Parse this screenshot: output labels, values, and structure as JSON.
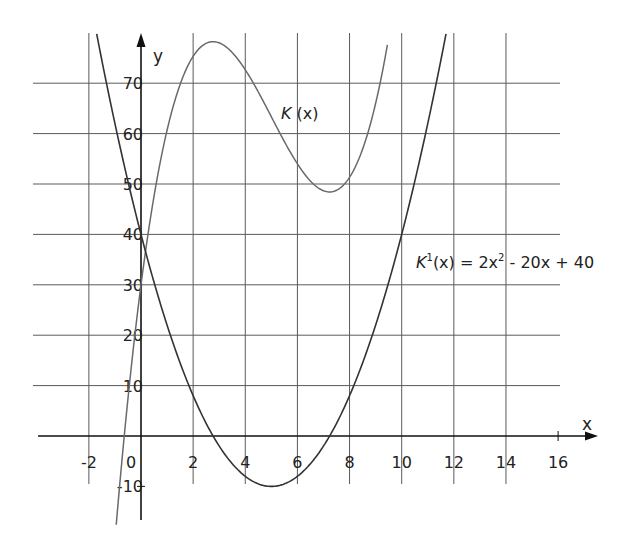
{
  "chart_data": {
    "type": "line",
    "title": "",
    "xlabel": "x",
    "ylabel": "y",
    "xlim": [
      -4.2,
      17.5
    ],
    "ylim": [
      -16.6,
      80
    ],
    "grid": true,
    "x_ticks": [
      -2,
      0,
      2,
      4,
      6,
      8,
      10,
      12,
      14,
      16
    ],
    "x_tick_labels": [
      "-2",
      "0",
      "2",
      "4",
      "6",
      "8",
      "10",
      "12",
      "14",
      "16"
    ],
    "y_ticks": [
      -10,
      10,
      20,
      30,
      40,
      50,
      60,
      70
    ],
    "y_tick_labels": [
      "-10",
      "10",
      "20",
      "30",
      "40",
      "50",
      "60",
      "70"
    ],
    "grid_x": [
      -2,
      2,
      4,
      6,
      8,
      10,
      12,
      14
    ],
    "grid_y": [
      10,
      20,
      30,
      40,
      50,
      60,
      70
    ],
    "series": [
      {
        "name": "K(x)",
        "formula": "K(x) = (2/3)x^3 - 10x^2 + 40x + 30",
        "coefficients": [
          30,
          40,
          -10,
          0.6667
        ],
        "x_range": [
          -0.95,
          9.45
        ],
        "key_points": [
          [
            0,
            30
          ],
          [
            2.76,
            78.2
          ],
          [
            7.24,
            48.6
          ]
        ],
        "color": "#6a6a6a"
      },
      {
        "name": "K'(x)",
        "formula": "K'(x) = 2x^2 - 20x + 40",
        "coefficients": [
          40,
          -20,
          2
        ],
        "x_range": [
          -1.7,
          11.7
        ],
        "key_points": [
          [
            0,
            40
          ],
          [
            5,
            -10
          ],
          [
            2.76,
            0
          ],
          [
            7.24,
            0
          ]
        ],
        "color": "#333333"
      }
    ],
    "annotations": [
      {
        "text_main": "K",
        "text_rest": " (x)",
        "x": 5.5,
        "y": 63
      },
      {
        "text_main": "K",
        "sup": "1",
        "text_rest": "(x) = 2x",
        "sup2": "2",
        "text_tail": " - 20x + 40",
        "x": 10.2,
        "y": 34
      }
    ]
  },
  "labels": {
    "x_axis": "x",
    "y_axis": "y",
    "k_label_k": "K",
    "k_label_rest": " (x)",
    "kp_k": "K",
    "kp_sup1": "1",
    "kp_mid": "(x) = 2x",
    "kp_sup2": "2",
    "kp_tail": " - 20x + 40"
  }
}
